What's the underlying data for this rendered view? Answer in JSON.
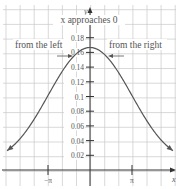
{
  "chart_data": {
    "type": "line",
    "title": "",
    "function": "f(x) = (x - sin x) / x^3",
    "xlabel": "x",
    "ylabel": "y",
    "xlim": [
      -6.28,
      6.28
    ],
    "ylim": [
      0,
      0.2
    ],
    "grid": true,
    "x_ticks": [
      {
        "value": -3.14159,
        "label": "−π"
      },
      {
        "value": 3.14159,
        "label": "π"
      }
    ],
    "y_ticks": [
      {
        "value": 0.02,
        "label": "0.02"
      },
      {
        "value": 0.04,
        "label": "0.04"
      },
      {
        "value": 0.06,
        "label": "0.06"
      },
      {
        "value": 0.08,
        "label": "0.08"
      },
      {
        "value": 0.1,
        "label": "0.1"
      },
      {
        "value": 0.12,
        "label": "0.12"
      },
      {
        "value": 0.14,
        "label": "0.14"
      },
      {
        "value": 0.16,
        "label": "0.16"
      },
      {
        "value": 0.18,
        "label": "0.18"
      }
    ],
    "series": [
      {
        "name": "f(x)",
        "x": [
          -6.28,
          -5,
          -4,
          -3.14,
          -2,
          -1,
          0,
          1,
          2,
          3.14,
          4,
          5,
          6.28
        ],
        "y": [
          0.025,
          0.048,
          0.074,
          0.101,
          0.136,
          0.159,
          0.1667,
          0.159,
          0.136,
          0.101,
          0.074,
          0.048,
          0.025
        ]
      }
    ],
    "annotations": [
      {
        "text": "x approaches 0",
        "position": "top-center"
      },
      {
        "text": "from the left",
        "arrow": "right",
        "position": "left of y-axis near y=0.16"
      },
      {
        "text": "from the right",
        "arrow": "left",
        "position": "right of y-axis near y=0.16"
      }
    ],
    "colors": {
      "curve": "#555555",
      "grid": "#c8c8c8",
      "axis": "#333333",
      "text": "#666666"
    }
  }
}
